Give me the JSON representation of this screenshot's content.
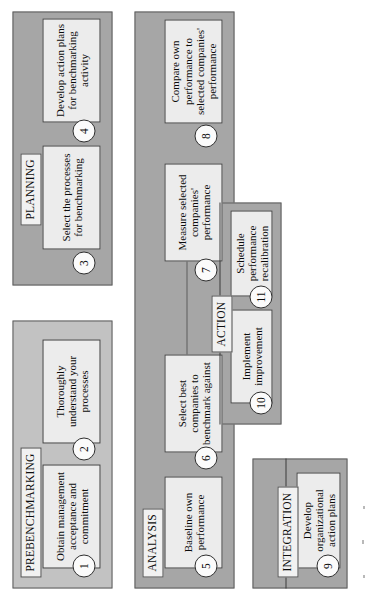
{
  "diagram": {
    "orientation": "rotated-90-ccw",
    "colors": {
      "panel_fill": "#a6a6a6",
      "panel_fill_light": "#c2c2c2",
      "panel_border": "#5d5d5d",
      "step_fill": "#ececec",
      "step_border": "#3c3c3c",
      "label_fill": "#f1f1f1",
      "page_background": "#ffffff"
    },
    "phases": [
      {
        "id": "prebenchmarking",
        "label": "PREBENCHMARKING"
      },
      {
        "id": "planning",
        "label": "PLANNING"
      },
      {
        "id": "analysis",
        "label": "ANALYSIS"
      },
      {
        "id": "integration",
        "label": "INTEGRATION"
      },
      {
        "id": "action",
        "label": "ACTION"
      }
    ],
    "steps": [
      {
        "number": "1",
        "phase": "prebenchmarking",
        "text": "Obtain management acceptance and commitment"
      },
      {
        "number": "2",
        "phase": "prebenchmarking",
        "text": "Thoroughly understand your processes"
      },
      {
        "number": "3",
        "phase": "planning",
        "text": "Select the processes for benchmarking"
      },
      {
        "number": "4",
        "phase": "planning",
        "text": "Develop action plans for benchmarking activity"
      },
      {
        "number": "5",
        "phase": "analysis",
        "text": "Baseline own performance"
      },
      {
        "number": "6",
        "phase": "analysis",
        "text": "Select best companies to benchmark against"
      },
      {
        "number": "7",
        "phase": "analysis",
        "text": "Measure selected companies' performance"
      },
      {
        "number": "8",
        "phase": "analysis",
        "text": "Compare own performance to selected companies' performance"
      },
      {
        "number": "9",
        "phase": "integration",
        "text": "Develop organizational action plans"
      },
      {
        "number": "10",
        "phase": "action",
        "text": "Implement improvement"
      },
      {
        "number": "11",
        "phase": "action",
        "text": "Schedule performance recalibration"
      }
    ]
  }
}
